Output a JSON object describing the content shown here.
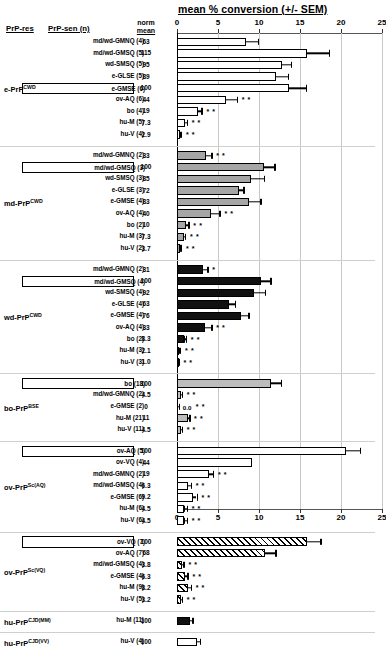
{
  "chart_data": {
    "type": "bar",
    "title": "mean % conversion (+/- SEM)",
    "xlabel": "mean % conversion (+/- SEM)",
    "ylabel": "",
    "orientation": "horizontal",
    "xlim": [
      0,
      25
    ],
    "xticks": [
      0,
      5,
      10,
      15,
      20,
      25
    ],
    "xticklabels": [
      "0",
      "5",
      "10",
      "15",
      "20",
      "25"
    ],
    "grid": true,
    "axis_position": "both top and bottom",
    "columns": [
      "PrP-res",
      "PrP-sen (n)",
      "norm mean",
      "mean % conversion (+/- SEM)"
    ],
    "significance_note": "* = p<0.05, ** = p<0.01 vs homologous reaction",
    "groups": [
      {
        "prp_res": "e-PrP",
        "prp_res_sup": "CWD",
        "fill": "white",
        "rows": [
          {
            "label": "md/wd-GMNQ (4)",
            "norm": "63",
            "value": 8.4,
            "sem": 1.6,
            "stars": "",
            "boxed": false
          },
          {
            "label": "md/wd-GMSQ (5)",
            "norm": "115",
            "value": 15.8,
            "sem": 2.8,
            "stars": "",
            "boxed": false
          },
          {
            "label": "wd-SMSQ (5)",
            "norm": "95",
            "value": 12.8,
            "sem": 1.2,
            "stars": "",
            "boxed": false
          },
          {
            "label": "e-GLSE (5)",
            "norm": "89",
            "value": 12.1,
            "sem": 1.5,
            "stars": "",
            "boxed": false
          },
          {
            "label": "e-GMSE (6)",
            "norm": "100",
            "value": 13.7,
            "sem": 2.1,
            "stars": "",
            "boxed": true
          },
          {
            "label": "ov-AQ (6)",
            "norm": "44",
            "value": 6.0,
            "sem": 1.4,
            "stars": "* *",
            "boxed": false
          },
          {
            "label": "bo (4)",
            "norm": "19",
            "value": 2.6,
            "sem": 0.5,
            "stars": "* *",
            "boxed": false
          },
          {
            "label": "hu-M (5)",
            "norm": "7.3",
            "value": 1.0,
            "sem": 0.3,
            "stars": "* *",
            "boxed": false
          },
          {
            "label": "hu-V (4)",
            "norm": "2.9",
            "value": 0.4,
            "sem": 0.2,
            "stars": "* *",
            "boxed": false
          }
        ]
      },
      {
        "prp_res": "md-PrP",
        "prp_res_sup": "CWD",
        "fill": "gray",
        "rows": [
          {
            "label": "md/wd-GMNQ (2)",
            "norm": "33",
            "value": 3.5,
            "sem": 0.8,
            "stars": "* *",
            "boxed": false
          },
          {
            "label": "md/wd-GMSQ (3)",
            "norm": "100",
            "value": 10.6,
            "sem": 1.4,
            "stars": "",
            "boxed": true
          },
          {
            "label": "wd-SMSQ (3)",
            "norm": "85",
            "value": 9.0,
            "sem": 1.7,
            "stars": "",
            "boxed": false
          },
          {
            "label": "e-GLSE (3)",
            "norm": "72",
            "value": 7.6,
            "sem": 0.6,
            "stars": "",
            "boxed": false
          },
          {
            "label": "e-GMSE (4)",
            "norm": "83",
            "value": 8.8,
            "sem": 1.5,
            "stars": "",
            "boxed": false
          },
          {
            "label": "ov-AQ (4)",
            "norm": "40",
            "value": 4.2,
            "sem": 1.1,
            "stars": "* *",
            "boxed": false
          },
          {
            "label": "bo (2)",
            "norm": "10",
            "value": 1.1,
            "sem": 0.4,
            "stars": "* *",
            "boxed": false
          },
          {
            "label": "hu-M (3)",
            "norm": "7.3",
            "value": 0.8,
            "sem": 0.3,
            "stars": "* *",
            "boxed": false
          },
          {
            "label": "hu-V (2)",
            "norm": "3.7",
            "value": 0.4,
            "sem": 0.2,
            "stars": "* *",
            "boxed": false
          }
        ]
      },
      {
        "prp_res": "wd-PrP",
        "prp_res_sup": "CWD",
        "fill": "black",
        "rows": [
          {
            "label": "md/wd-GMNQ (2)",
            "norm": "31",
            "value": 3.2,
            "sem": 0.6,
            "stars": "*",
            "boxed": false
          },
          {
            "label": "md/wd-GMSQ (4)",
            "norm": "100",
            "value": 10.2,
            "sem": 1.3,
            "stars": "",
            "boxed": true
          },
          {
            "label": "wd-SMSQ (4)",
            "norm": "92",
            "value": 9.4,
            "sem": 1.4,
            "stars": "",
            "boxed": false
          },
          {
            "label": "e-GLSE (4)",
            "norm": "63",
            "value": 6.4,
            "sem": 0.8,
            "stars": "",
            "boxed": false
          },
          {
            "label": "e-GMSE (4)",
            "norm": "76",
            "value": 7.8,
            "sem": 1.0,
            "stars": "",
            "boxed": false
          },
          {
            "label": "ov-AQ (4)",
            "norm": "33",
            "value": 3.4,
            "sem": 0.9,
            "stars": "* *",
            "boxed": false
          },
          {
            "label": "bo (2)",
            "norm": "8.3",
            "value": 0.9,
            "sem": 0.3,
            "stars": "* *",
            "boxed": false
          },
          {
            "label": "hu-M (3)",
            "norm": "2.1",
            "value": 0.3,
            "sem": 0.2,
            "stars": "* *",
            "boxed": false
          },
          {
            "label": "hu-V (3)",
            "norm": "1.0",
            "value": 0.2,
            "sem": 0.1,
            "stars": "* *",
            "boxed": false
          }
        ]
      },
      {
        "prp_res": "bo-PrP",
        "prp_res_sup": "BSE",
        "fill": "lightgray",
        "rows": [
          {
            "label": "bo (18)",
            "norm": "100",
            "value": 11.5,
            "sem": 1.3,
            "stars": "",
            "boxed": true
          },
          {
            "label": "md/wd-GMNQ (2)",
            "norm": "4.5",
            "value": 0.5,
            "sem": 0.2,
            "stars": "* *",
            "boxed": false
          },
          {
            "label": "e-GMSE (2)",
            "norm": "0",
            "value": 0.0,
            "sem": 0.35,
            "stars": "* *",
            "zero_label": "0.0",
            "boxed": false
          },
          {
            "label": "hu-M (21)",
            "norm": "11",
            "value": 1.3,
            "sem": 0.3,
            "stars": "* *",
            "boxed": false
          },
          {
            "label": "hu-V (11)",
            "norm": "4.5",
            "value": 0.5,
            "sem": 0.2,
            "stars": "* *",
            "boxed": false
          }
        ]
      },
      {
        "prp_res": "ov-PrP",
        "prp_res_sup": "Sc(AQ)",
        "fill": "white",
        "rows": [
          {
            "label": "ov-AQ (5)",
            "norm": "100",
            "value": 20.6,
            "sem": 1.8,
            "stars": "",
            "boxed": true
          },
          {
            "label": "ov-VQ (4)",
            "norm": "44",
            "value": 9.1,
            "sem": 0.0,
            "stars": "",
            "boxed": false
          },
          {
            "label": "md/wd-GMNQ (2)",
            "norm": "19",
            "value": 3.9,
            "sem": 0.6,
            "stars": "* *",
            "boxed": false
          },
          {
            "label": "md/wd-GMSQ (4)",
            "norm": "6.3",
            "value": 1.3,
            "sem": 0.5,
            "stars": "* *",
            "boxed": false
          },
          {
            "label": "e-GMSE (6)",
            "norm": "9.2",
            "value": 1.9,
            "sem": 0.6,
            "stars": "* *",
            "boxed": false
          },
          {
            "label": "hu-M (6)",
            "norm": "4.5",
            "value": 0.9,
            "sem": 0.4,
            "stars": "* *",
            "boxed": false
          },
          {
            "label": "hu-V (6)",
            "norm": "4.5",
            "value": 0.9,
            "sem": 0.4,
            "stars": "* *",
            "boxed": false
          }
        ]
      },
      {
        "prp_res": "ov-PrP",
        "prp_res_sup": "Sc(VQ)",
        "fill": "hatch",
        "rows": [
          {
            "label": "ov-VQ (7)",
            "norm": "100",
            "value": 15.8,
            "sem": 1.8,
            "stars": "",
            "boxed": true
          },
          {
            "label": "ov-AQ (7)",
            "norm": "68",
            "value": 10.7,
            "sem": 1.4,
            "stars": "",
            "boxed": false
          },
          {
            "label": "md/wd-GMSQ (4)",
            "norm": "3.8",
            "value": 0.6,
            "sem": 0.3,
            "stars": "* *",
            "boxed": false
          },
          {
            "label": "e-GMSE (4)",
            "norm": "6.3",
            "value": 1.0,
            "sem": 0.4,
            "stars": "* *",
            "boxed": false
          },
          {
            "label": "hu-M (9)",
            "norm": "8.2",
            "value": 1.3,
            "sem": 0.5,
            "stars": "* *",
            "boxed": false
          },
          {
            "label": "hu-V (5)",
            "norm": "3.2",
            "value": 0.5,
            "sem": 0.2,
            "stars": "* *",
            "boxed": false
          }
        ]
      },
      {
        "prp_res": "hu-PrP",
        "prp_res_sup": "CJD(MM)",
        "fill": "black",
        "rows": [
          {
            "label": "hu-M (11)",
            "norm": "100",
            "value": 1.6,
            "sem": 0.4,
            "stars": "",
            "boxed": false
          }
        ]
      },
      {
        "prp_res": "hu-PrP",
        "prp_res_sup": "CJD(VV)",
        "fill": "white",
        "rows": [
          {
            "label": "hu-V (4)",
            "norm": "100",
            "value": 2.4,
            "sem": 0.5,
            "stars": "",
            "boxed": false
          }
        ]
      }
    ]
  },
  "headers": {
    "prp_res": "PrP-res",
    "prp_sen": "PrP-sen (n)",
    "norm_line1": "norm",
    "norm_line2": "mean"
  }
}
